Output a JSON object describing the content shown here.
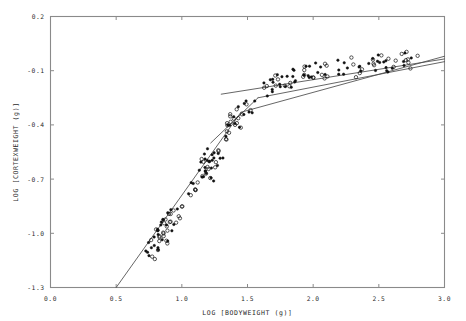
{
  "figure": {
    "name": "cortex-weight-vs-bodyweight-scatter",
    "background": "#ffffff",
    "frame_color": "#8a8a8a",
    "marker_color": "#111111",
    "line_color": "#4a4a4a"
  },
  "axes": {
    "x": {
      "label": "LOG [BODYWEIGHT (g)]",
      "ticks": [
        "0.0",
        "0.5",
        "1.0",
        "1.5",
        "2.0",
        "2.5",
        "3.0"
      ],
      "tick_values": [
        0.0,
        0.5,
        1.0,
        1.5,
        2.0,
        2.5,
        3.0
      ],
      "min": 0.0,
      "max": 3.0
    },
    "y": {
      "label": "LOG [CORTEXWEIGHT (g)]",
      "ticks": [
        "0.2",
        "-0.1",
        "-0.4",
        "-0.7",
        "-1.0",
        "-1.3"
      ],
      "tick_values": [
        0.2,
        -0.1,
        -0.4,
        -0.7,
        -1.0,
        -1.3
      ],
      "min": -1.3,
      "max": 0.2
    }
  },
  "chart_data": {
    "type": "scatter",
    "title": "",
    "xlabel": "LOG [BODYWEIGHT (g)]",
    "ylabel": "LOG [CORTEXWEIGHT (g)]",
    "xlim": [
      0.0,
      3.0
    ],
    "ylim": [
      -1.3,
      0.2
    ],
    "grid": false,
    "legend": "none",
    "xticks": [
      0.0,
      0.5,
      1.0,
      1.5,
      2.0,
      2.5,
      3.0
    ],
    "yticks": [
      0.2,
      -0.1,
      -0.4,
      -0.7,
      -1.0,
      -1.3
    ],
    "series": [
      {
        "name": "observations",
        "marker": "mixed-open-and-filled-circles",
        "points": [
          [
            0.74,
            -1.11
          ],
          [
            0.76,
            -1.07
          ],
          [
            0.77,
            -1.13
          ],
          [
            0.78,
            -1.02
          ],
          [
            0.79,
            -1.16
          ],
          [
            0.8,
            -1.05
          ],
          [
            0.81,
            -0.98
          ],
          [
            0.82,
            -1.09
          ],
          [
            0.83,
            -1.0
          ],
          [
            0.84,
            -1.04
          ],
          [
            0.85,
            -0.95
          ],
          [
            0.86,
            -1.01
          ],
          [
            0.87,
            -0.92
          ],
          [
            0.88,
            -0.97
          ],
          [
            0.89,
            -1.06
          ],
          [
            0.9,
            -0.9
          ],
          [
            0.91,
            -0.99
          ],
          [
            0.92,
            -0.94
          ],
          [
            0.93,
            -0.88
          ],
          [
            0.95,
            -0.96
          ],
          [
            0.97,
            -0.85
          ],
          [
            0.99,
            -0.91
          ],
          [
            1.01,
            -0.87
          ],
          [
            1.06,
            -0.8
          ],
          [
            1.08,
            -0.72
          ],
          [
            1.1,
            -0.76
          ],
          [
            1.12,
            -0.66
          ],
          [
            1.13,
            -0.71
          ],
          [
            1.14,
            -0.62
          ],
          [
            1.15,
            -0.69
          ],
          [
            1.16,
            -0.58
          ],
          [
            1.17,
            -0.64
          ],
          [
            1.18,
            -0.6
          ],
          [
            1.19,
            -0.67
          ],
          [
            1.2,
            -0.55
          ],
          [
            1.21,
            -0.63
          ],
          [
            1.22,
            -0.59
          ],
          [
            1.23,
            -0.7
          ],
          [
            1.24,
            -0.57
          ],
          [
            1.26,
            -0.62
          ],
          [
            1.28,
            -0.54
          ],
          [
            1.3,
            -0.6
          ],
          [
            1.33,
            -0.47
          ],
          [
            1.35,
            -0.42
          ],
          [
            1.36,
            -0.39
          ],
          [
            1.37,
            -0.45
          ],
          [
            1.38,
            -0.36
          ],
          [
            1.39,
            -0.41
          ],
          [
            1.4,
            -0.34
          ],
          [
            1.41,
            -0.38
          ],
          [
            1.42,
            -0.31
          ],
          [
            1.43,
            -0.43
          ],
          [
            1.44,
            -0.37
          ],
          [
            1.45,
            -0.33
          ],
          [
            1.46,
            -0.4
          ],
          [
            1.47,
            -0.3
          ],
          [
            1.48,
            -0.35
          ],
          [
            1.5,
            -0.28
          ],
          [
            1.52,
            -0.32
          ],
          [
            1.54,
            -0.26
          ],
          [
            1.62,
            -0.21
          ],
          [
            1.64,
            -0.18
          ],
          [
            1.66,
            -0.23
          ],
          [
            1.68,
            -0.16
          ],
          [
            1.7,
            -0.2
          ],
          [
            1.72,
            -0.14
          ],
          [
            1.74,
            -0.19
          ],
          [
            1.76,
            -0.12
          ],
          [
            1.78,
            -0.17
          ],
          [
            1.8,
            -0.13
          ],
          [
            1.82,
            -0.18
          ],
          [
            1.84,
            -0.11
          ],
          [
            1.86,
            -0.15
          ],
          [
            1.92,
            -0.13
          ],
          [
            1.94,
            -0.09
          ],
          [
            1.96,
            -0.14
          ],
          [
            1.98,
            -0.08
          ],
          [
            2.0,
            -0.12
          ],
          [
            2.02,
            -0.06
          ],
          [
            2.04,
            -0.11
          ],
          [
            2.06,
            -0.09
          ],
          [
            2.08,
            -0.14
          ],
          [
            2.1,
            -0.07
          ],
          [
            2.12,
            -0.12
          ],
          [
            2.18,
            -0.1
          ],
          [
            2.2,
            -0.06
          ],
          [
            2.22,
            -0.11
          ],
          [
            2.24,
            -0.05
          ],
          [
            2.26,
            -0.09
          ],
          [
            2.28,
            -0.04
          ],
          [
            2.3,
            -0.08
          ],
          [
            2.32,
            -0.12
          ],
          [
            2.34,
            -0.06
          ],
          [
            2.36,
            -0.1
          ],
          [
            2.42,
            -0.07
          ],
          [
            2.44,
            -0.03
          ],
          [
            2.46,
            -0.08
          ],
          [
            2.48,
            -0.02
          ],
          [
            2.5,
            -0.06
          ],
          [
            2.52,
            -0.01
          ],
          [
            2.54,
            -0.05
          ],
          [
            2.56,
            -0.09
          ],
          [
            2.58,
            -0.04
          ],
          [
            2.6,
            -0.07
          ],
          [
            2.64,
            -0.05
          ],
          [
            2.66,
            -0.01
          ],
          [
            2.68,
            -0.06
          ],
          [
            2.7,
            0.0
          ],
          [
            2.72,
            -0.04
          ],
          [
            2.74,
            -0.08
          ],
          [
            2.76,
            -0.03
          ],
          [
            2.78,
            -0.02
          ]
        ]
      }
    ],
    "fit_lines": [
      {
        "name": "segmented-fit-lower",
        "style": "solid",
        "x0": 0.5,
        "y0": -1.3,
        "x1": 1.45,
        "y1": -0.33
      },
      {
        "name": "segmented-fit-upper",
        "style": "solid",
        "x0": 1.45,
        "y0": -0.33,
        "x1": 3.0,
        "y1": -0.02
      },
      {
        "name": "secondary-regression-lower",
        "style": "solid",
        "x0": 1.22,
        "y0": -0.5,
        "x1": 1.58,
        "y1": -0.25
      },
      {
        "name": "secondary-regression-upper",
        "style": "solid",
        "x0": 1.58,
        "y0": -0.25,
        "x1": 3.0,
        "y1": -0.05
      },
      {
        "name": "overall-regression",
        "style": "solid",
        "x0": 1.3,
        "y0": -0.23,
        "x1": 3.0,
        "y1": -0.035
      }
    ]
  }
}
